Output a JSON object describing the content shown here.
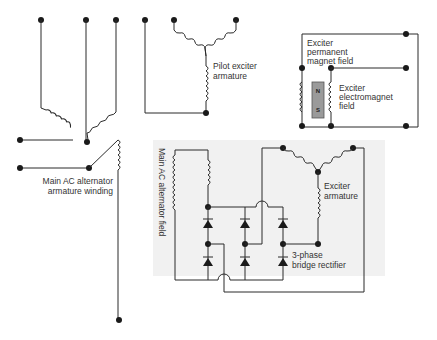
{
  "diagram": {
    "labels": {
      "pilot_exciter": [
        "Pilot exciter",
        "armature"
      ],
      "exciter_pm_field": [
        "Exciter",
        "permanent",
        "magnet field"
      ],
      "exciter_em_field": [
        "Exciter",
        "electromagnet",
        "field"
      ],
      "magnet_north": "N",
      "magnet_south": "S",
      "main_ac_winding": [
        "Main AC alternator",
        "armature winding"
      ],
      "main_ac_field": "Main AC alternator field",
      "exciter_armature": [
        "Exciter",
        "armature"
      ],
      "rectifier": [
        "3-phase",
        "bridge rectifier"
      ]
    },
    "colors": {
      "line": "#2a2a2a",
      "shaded_panel": "#f1f1f1",
      "magnet_fill": "#9a9a9a"
    }
  }
}
